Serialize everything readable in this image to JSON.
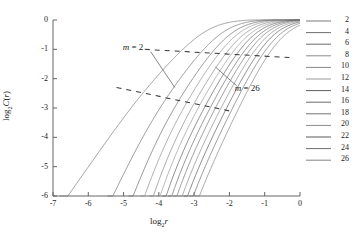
{
  "chart_data": {
    "type": "line",
    "title": "",
    "xlabel": "log₂r",
    "ylabel": "log₂C(r)",
    "xlim": [
      -7,
      0
    ],
    "ylim": [
      -6,
      0
    ],
    "xticks": [
      -7,
      -6,
      -5,
      -4,
      -3,
      -2,
      -1,
      0
    ],
    "yticks": [
      -6,
      -5,
      -4,
      -3,
      -2,
      -1,
      0
    ],
    "xtick_labels": [
      "-7",
      "-6",
      "-5",
      "-4",
      "-3",
      "-2",
      "-1",
      "0"
    ],
    "ytick_labels": [
      "-6",
      "-5",
      "-4",
      "-3",
      "-2",
      "-1",
      "0"
    ],
    "grid": false,
    "legend_position": "right",
    "legend_title": "",
    "legend_entries": [
      "2",
      "4",
      "6",
      "8",
      "10",
      "12",
      "14",
      "16",
      "18",
      "20",
      "22",
      "24",
      "26"
    ],
    "series": [
      {
        "name": "2",
        "color": "#7a7a7a",
        "knee_x": -4.55,
        "sat_x": -2.6,
        "foot_x": -6.82,
        "slope_low": 1.72,
        "slope_mid": 1.3
      },
      {
        "name": "4",
        "color": "#6f6f6f",
        "knee_x": -4.25,
        "sat_x": -2.18,
        "foot_x": -5.95,
        "slope_low": 2.55,
        "slope_mid": 1.6
      },
      {
        "name": "6",
        "color": "#6a6a6a",
        "knee_x": -4.1,
        "sat_x": -1.95,
        "foot_x": -5.32,
        "slope_low": 3.3,
        "slope_mid": 1.78
      },
      {
        "name": "8",
        "color": "#8d8d8d",
        "knee_x": -4.02,
        "sat_x": -1.78,
        "foot_x": -5.06,
        "slope_low": 3.9,
        "slope_mid": 1.9
      },
      {
        "name": "10",
        "color": "#868686",
        "knee_x": -3.96,
        "sat_x": -1.62,
        "foot_x": -4.92,
        "slope_low": 4.4,
        "slope_mid": 2.0
      },
      {
        "name": "12",
        "color": "#9a9a9a",
        "knee_x": -3.92,
        "sat_x": -1.48,
        "foot_x": -4.82,
        "slope_low": 4.85,
        "slope_mid": 2.08
      },
      {
        "name": "14",
        "color": "#5e5e5e",
        "knee_x": -3.88,
        "sat_x": -1.35,
        "foot_x": -4.34,
        "slope_low": 5.3,
        "slope_mid": 2.15
      },
      {
        "name": "16",
        "color": "#6b6b6b",
        "knee_x": -3.85,
        "sat_x": -1.22,
        "foot_x": -4.18,
        "slope_low": 5.7,
        "slope_mid": 2.22
      },
      {
        "name": "18",
        "color": "#747474",
        "knee_x": -3.82,
        "sat_x": -1.1,
        "foot_x": -4.06,
        "slope_low": 6.1,
        "slope_mid": 2.28
      },
      {
        "name": "20",
        "color": "#8a8a8a",
        "knee_x": -3.8,
        "sat_x": -0.97,
        "foot_x": -3.97,
        "slope_low": 6.5,
        "slope_mid": 2.34
      },
      {
        "name": "22",
        "color": "#5a5a5a",
        "knee_x": -3.78,
        "sat_x": -0.84,
        "foot_x": -3.9,
        "slope_low": 6.9,
        "slope_mid": 2.4
      },
      {
        "name": "24",
        "color": "#707070",
        "knee_x": -3.76,
        "sat_x": -0.7,
        "foot_x": -3.83,
        "slope_low": 7.3,
        "slope_mid": 2.46
      },
      {
        "name": "26",
        "color": "#838383",
        "knee_x": -3.74,
        "sat_x": -0.55,
        "foot_x": -3.77,
        "slope_low": 7.7,
        "slope_mid": 2.52
      }
    ],
    "annotations": [
      {
        "label": "m = 2",
        "text_x": -4.4,
        "text_y": -0.95,
        "leader_to_x": -3.55,
        "leader_to_y": -2.3
      },
      {
        "label": "m = 26",
        "text_x": -1.85,
        "text_y": -2.35,
        "leader_to_x": -2.4,
        "leader_to_y": -1.6
      }
    ],
    "guide_lines": [
      {
        "name": "upper-dashed-guide",
        "x1": -4.4,
        "y1": -1.0,
        "x2": -0.3,
        "y2": -1.28
      },
      {
        "name": "lower-dashed-guide",
        "x1": -5.2,
        "y1": -2.3,
        "x2": -2.0,
        "y2": -3.1
      }
    ]
  }
}
